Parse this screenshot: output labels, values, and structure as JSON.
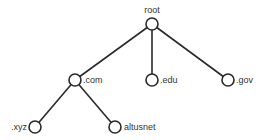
{
  "diagram": {
    "type": "tree",
    "nodes": [
      {
        "id": "root",
        "label": "root",
        "x": 152,
        "y": 24,
        "label_pos": "above"
      },
      {
        "id": "com",
        "label": ".com",
        "x": 75,
        "y": 80,
        "label_pos": "right"
      },
      {
        "id": "edu",
        "label": ".edu",
        "x": 152,
        "y": 80,
        "label_pos": "right"
      },
      {
        "id": "gov",
        "label": ".gov",
        "x": 228,
        "y": 80,
        "label_pos": "right"
      },
      {
        "id": "xyz",
        "label": ".xyz",
        "x": 35,
        "y": 127,
        "label_pos": "left"
      },
      {
        "id": "altusnet",
        "label": "altusnet",
        "x": 115,
        "y": 127,
        "label_pos": "right"
      }
    ],
    "edges": [
      {
        "from": "root",
        "to": "com"
      },
      {
        "from": "root",
        "to": "edu"
      },
      {
        "from": "root",
        "to": "gov"
      },
      {
        "from": "com",
        "to": "xyz"
      },
      {
        "from": "com",
        "to": "altusnet"
      }
    ],
    "colors": {
      "line": "#2a2a2a",
      "text": "#333333",
      "background": "#ffffff"
    }
  }
}
